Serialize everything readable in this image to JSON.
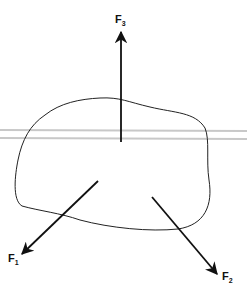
{
  "diagram": {
    "type": "free-body-diagram",
    "forces": [
      {
        "id": "F1",
        "label": "F",
        "subscript": "1",
        "direction": "down-left"
      },
      {
        "id": "F2",
        "label": "F",
        "subscript": "2",
        "direction": "down-right"
      },
      {
        "id": "F3",
        "label": "F",
        "subscript": "3",
        "direction": "up"
      }
    ],
    "colors": {
      "line": "#111111",
      "plane": "#c8c8c8",
      "background": "#ffffff"
    }
  }
}
